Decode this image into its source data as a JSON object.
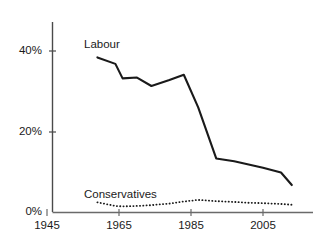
{
  "chart_data": {
    "type": "line",
    "title": "",
    "xlabel": "",
    "ylabel": "",
    "xlim": [
      1945,
      2015
    ],
    "ylim": [
      0,
      45
    ],
    "grid": false,
    "legend_position": "inline-annotation",
    "y_ticks": [
      "0%",
      "20%",
      "40%"
    ],
    "y_tick_values": [
      0,
      20,
      40
    ],
    "x_ticks": [
      "1945",
      "1965",
      "1985",
      "2005"
    ],
    "x_tick_values": [
      1945,
      1965,
      1985,
      2005
    ],
    "series": [
      {
        "name": "Labour",
        "style": "solid",
        "color": "#1a1a1a",
        "x": [
          1959,
          1964,
          1966,
          1970,
          1974,
          1979,
          1983,
          1987,
          1992,
          1997,
          2001,
          2005,
          2010,
          2013
        ],
        "values": [
          38.4,
          36.8,
          33.2,
          33.4,
          31.3,
          32.8,
          34.1,
          26.0,
          13.3,
          12.6,
          11.8,
          11.0,
          9.8,
          6.7
        ]
      },
      {
        "name": "Conservatives",
        "style": "dotted",
        "color": "#1a1a1a",
        "x": [
          1959,
          1964,
          1966,
          1970,
          1974,
          1979,
          1983,
          1987,
          1992,
          1997,
          2001,
          2005,
          2010,
          2013
        ],
        "values": [
          2.4,
          1.5,
          1.4,
          1.5,
          1.7,
          2.1,
          2.6,
          3.0,
          2.7,
          2.5,
          2.3,
          2.2,
          2.0,
          1.8
        ]
      }
    ],
    "annotations": [
      {
        "name": "labour-label",
        "text": "Labour",
        "x_px": 84,
        "y_px": 38
      },
      {
        "name": "conservatives-label",
        "text": "Conservatives",
        "x_px": 84,
        "y_px": 188
      }
    ]
  }
}
